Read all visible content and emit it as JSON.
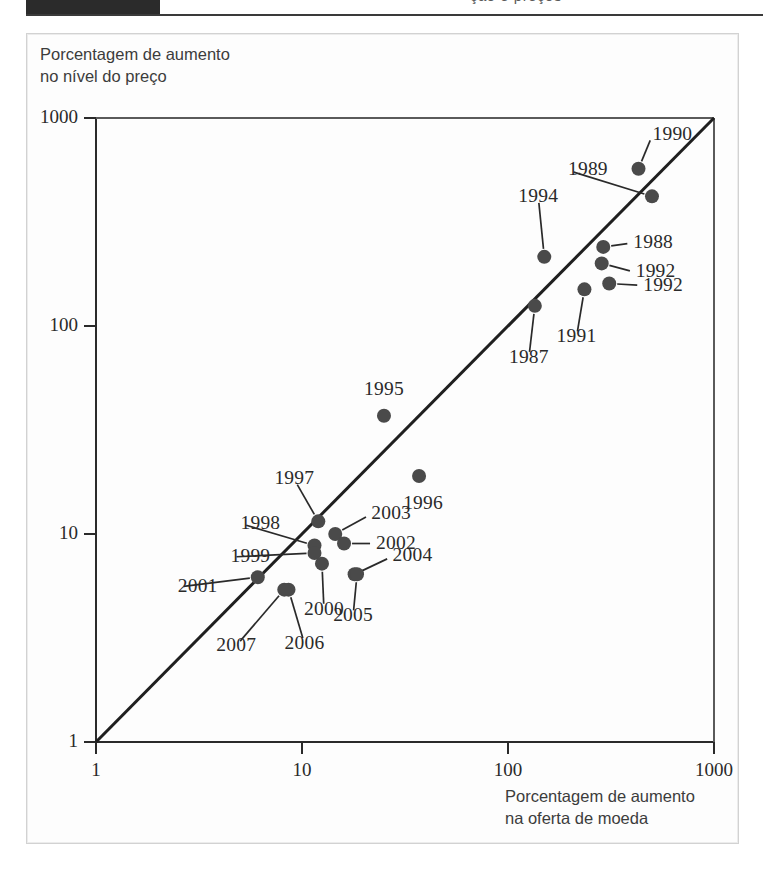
{
  "page": {
    "header_bar": "",
    "cutoff_text": "ção e preços"
  },
  "figure": {
    "y_axis_title": "Porcentagem de aumento\nno nível do preço",
    "x_axis_title": "Porcentagem de aumento\nna oferta de moeda"
  },
  "chart_data": {
    "type": "scatter",
    "title": "",
    "xlabel": "Porcentagem de aumento na oferta de moeda",
    "ylabel": "Porcentagem de aumento no nível do preço",
    "xscale": "log",
    "yscale": "log",
    "xlim": [
      1,
      1000
    ],
    "ylim": [
      1,
      1000
    ],
    "xticks": [
      "1",
      "10",
      "100",
      "1000"
    ],
    "yticks": [
      "1",
      "10",
      "100",
      "1000"
    ],
    "grid": false,
    "legend": null,
    "reference_line": {
      "name": "linha de 45 graus",
      "from": [
        1,
        1
      ],
      "to": [
        1000,
        1000
      ]
    },
    "points": [
      {
        "label": "1990",
        "x": 430,
        "y": 570
      },
      {
        "label": "1989",
        "x": 500,
        "y": 420
      },
      {
        "label": "1994",
        "x": 150,
        "y": 215
      },
      {
        "label": "1988",
        "x": 290,
        "y": 240
      },
      {
        "label": "1992",
        "x": 285,
        "y": 200
      },
      {
        "label": "1992",
        "x": 310,
        "y": 160
      },
      {
        "label": "1991",
        "x": 235,
        "y": 150
      },
      {
        "label": "1987",
        "x": 135,
        "y": 125
      },
      {
        "label": "1995",
        "x": 25,
        "y": 37
      },
      {
        "label": "1996",
        "x": 37,
        "y": 19
      },
      {
        "label": "1997",
        "x": 12,
        "y": 11.5
      },
      {
        "label": "2003",
        "x": 14.5,
        "y": 10
      },
      {
        "label": "1998",
        "x": 11.5,
        "y": 8.8
      },
      {
        "label": "1999",
        "x": 11.5,
        "y": 8.1
      },
      {
        "label": "2002",
        "x": 16,
        "y": 9
      },
      {
        "label": "2000",
        "x": 12.5,
        "y": 7.2
      },
      {
        "label": "2004",
        "x": 18,
        "y": 6.4
      },
      {
        "label": "2001",
        "x": 6.1,
        "y": 6.2
      },
      {
        "label": "2005",
        "x": 18.5,
        "y": 6.4
      },
      {
        "label": "2006",
        "x": 8.6,
        "y": 5.4
      },
      {
        "label": "2007",
        "x": 8.2,
        "y": 5.4
      }
    ]
  },
  "geometry": {
    "origin_px": [
      96,
      742
    ],
    "decade_px_x": 206,
    "decade_px_y": 208
  }
}
